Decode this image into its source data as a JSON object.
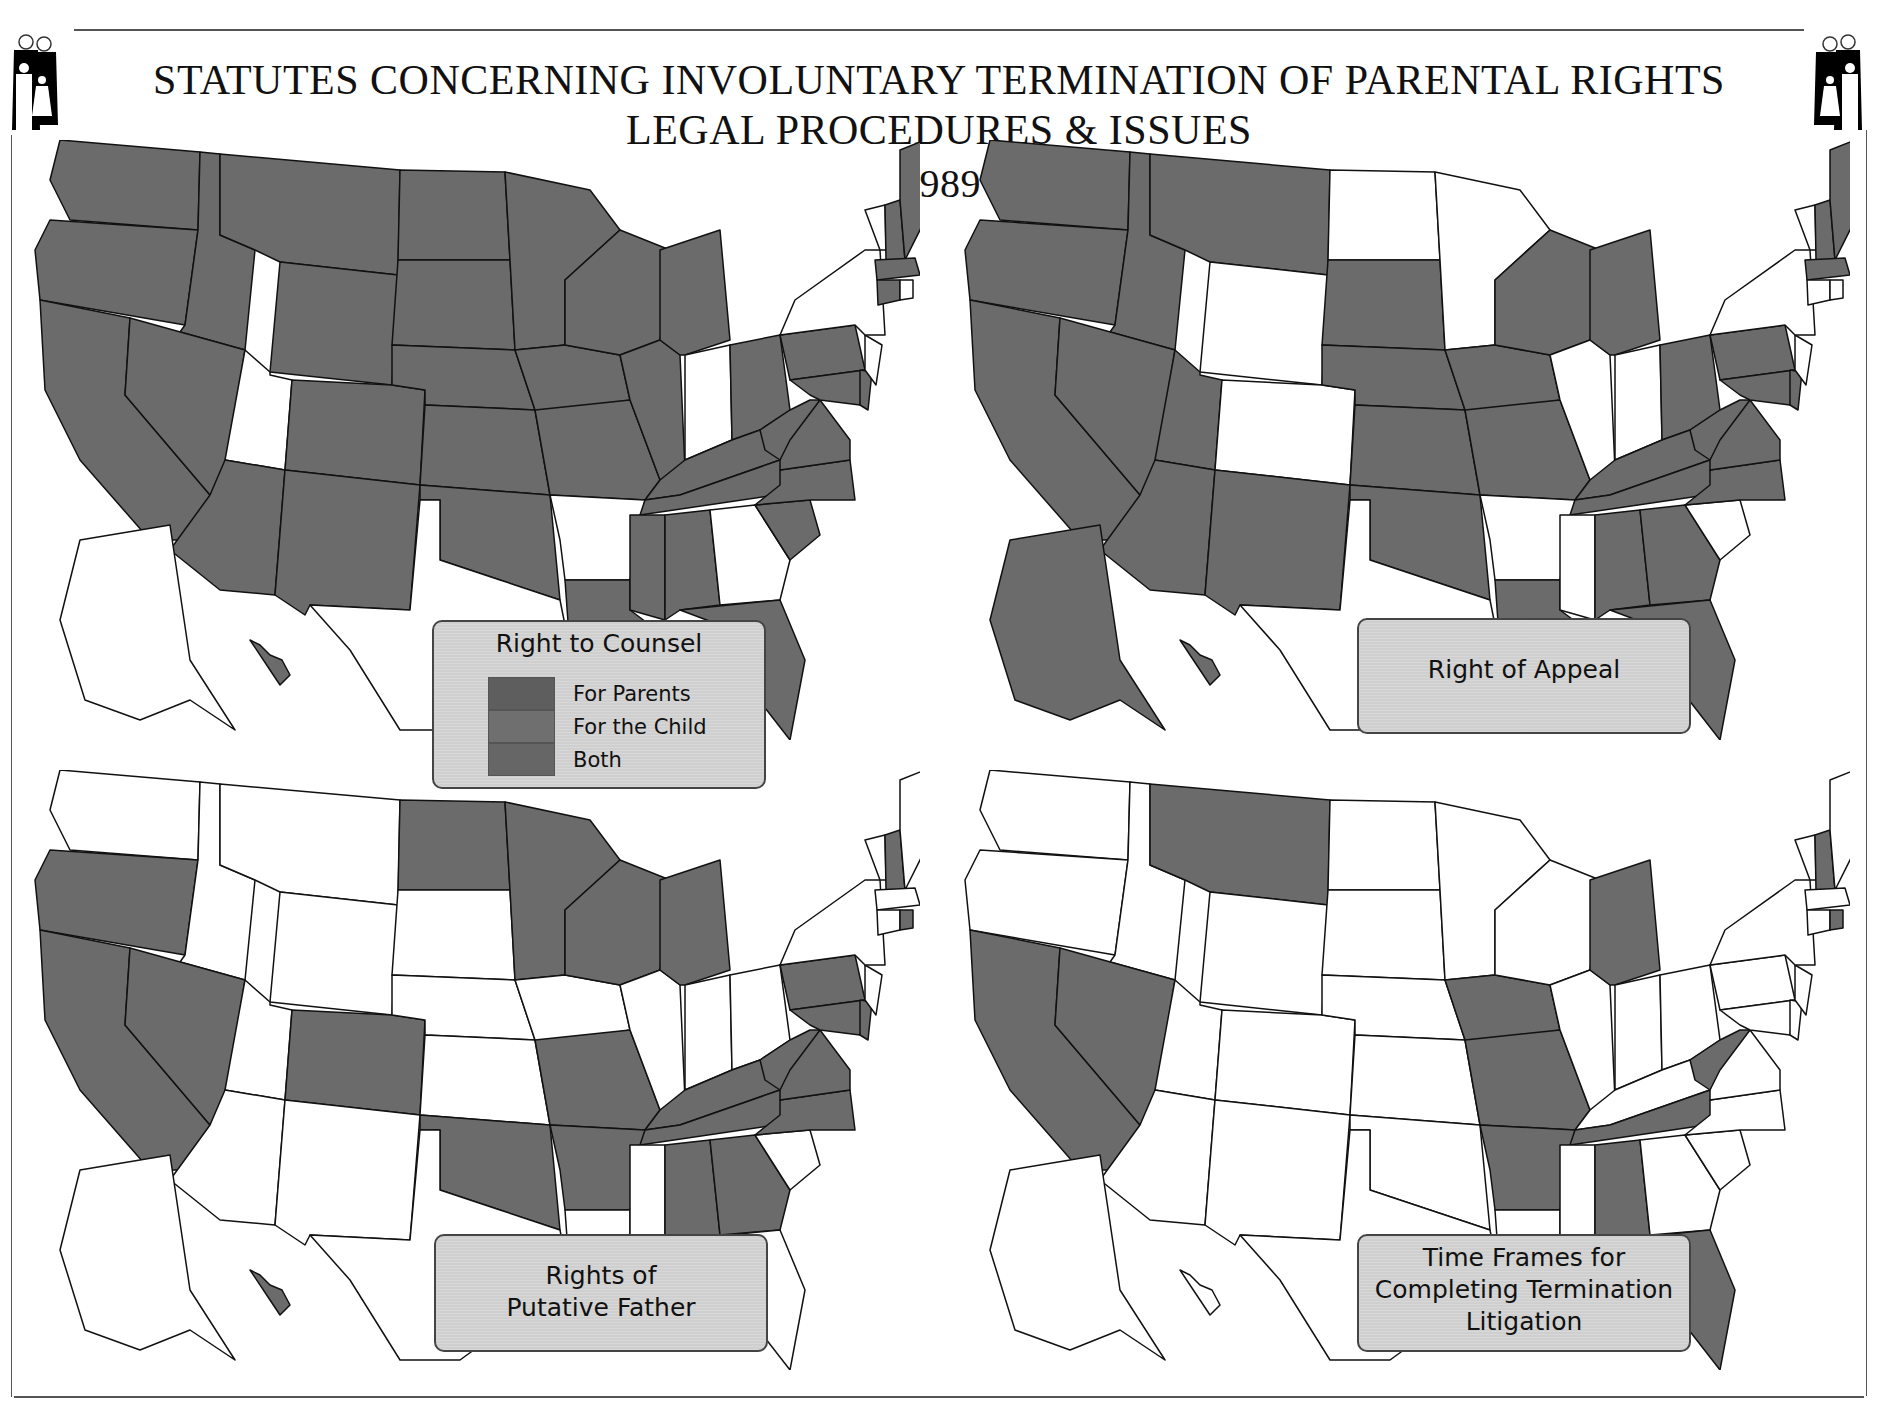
{
  "header": {
    "title_line1": "STATUTES CONCERNING INVOLUNTARY TERMINATION OF PARENTAL RIGHTS",
    "title_line2": "LEGAL PROCEDURES & ISSUES",
    "year": "1989",
    "logo_icon": "family-icon"
  },
  "colors": {
    "shaded": "#6b6b6b",
    "unshaded": "#ffffff",
    "border": "#111111",
    "legend_bg": "#cfcfcf",
    "for_parents": "#5e5e5e",
    "for_child": "#6f6f6f",
    "both": "#666666"
  },
  "maps": [
    {
      "id": "counsel",
      "legend_title": "Right to Counsel",
      "legend_items": [
        {
          "label": "For Parents",
          "color": "#5e5e5e"
        },
        {
          "label": "For the Child",
          "color": "#6f6f6f"
        },
        {
          "label": "Both",
          "color": "#666666"
        }
      ],
      "shaded_states": [
        "WA",
        "OR",
        "CA",
        "ID",
        "NV",
        "MT",
        "WY",
        "CO",
        "AZ",
        "NM",
        "ND",
        "SD",
        "NE",
        "KS",
        "OK",
        "MN",
        "IA",
        "MO",
        "WI",
        "IL",
        "MI",
        "OH",
        "KY",
        "TN",
        "WV",
        "VA",
        "NC",
        "SC",
        "PA",
        "MD",
        "DE",
        "LA",
        "MS",
        "AL",
        "FL",
        "ME",
        "NH",
        "MA",
        "CT",
        "HI"
      ]
    },
    {
      "id": "appeal",
      "legend_title": "Right of Appeal",
      "legend_items": [],
      "shaded_states": [
        "WA",
        "OR",
        "CA",
        "ID",
        "NV",
        "MT",
        "UT",
        "AZ",
        "NM",
        "SD",
        "NE",
        "KS",
        "OK",
        "IA",
        "MO",
        "WI",
        "MI",
        "OH",
        "KY",
        "TN",
        "WV",
        "VA",
        "NC",
        "PA",
        "MD",
        "DE",
        "LA",
        "AL",
        "GA",
        "FL",
        "ME",
        "NH",
        "MA",
        "AK",
        "HI"
      ]
    },
    {
      "id": "putative",
      "legend_title": "Rights of Putative Father",
      "legend_title_lines": [
        "Rights of",
        "Putative Father"
      ],
      "legend_items": [],
      "shaded_states": [
        "OR",
        "CA",
        "NV",
        "CO",
        "ND",
        "MN",
        "WI",
        "MI",
        "MO",
        "OK",
        "AR",
        "KY",
        "TN",
        "WV",
        "VA",
        "NC",
        "PA",
        "MD",
        "DE",
        "AL",
        "GA",
        "NH",
        "RI",
        "HI"
      ]
    },
    {
      "id": "timeframes",
      "legend_title": "Time Frames for Completing Termination Litigation",
      "legend_title_lines": [
        "Time Frames for",
        "Completing Termination",
        "Litigation"
      ],
      "legend_items": [],
      "shaded_states": [
        "CA",
        "NV",
        "MT",
        "IA",
        "MO",
        "AR",
        "MI",
        "TN",
        "AL",
        "FL",
        "WV",
        "NH",
        "RI"
      ]
    }
  ]
}
